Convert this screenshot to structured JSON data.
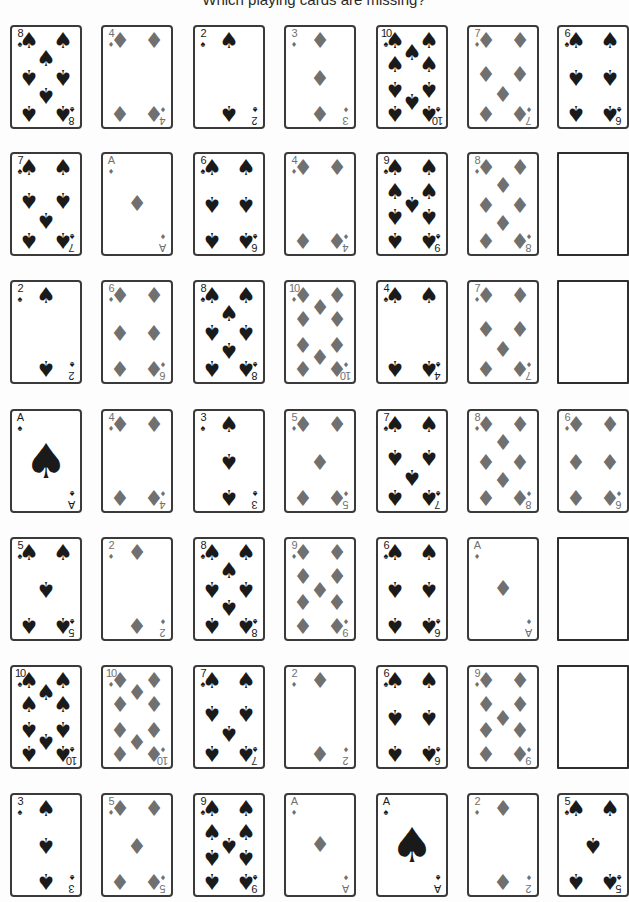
{
  "title": "Which playing cards are missing?",
  "colors": {
    "spade": "#1a1a1a",
    "diamond": "#707070",
    "border": "#3a3a3a",
    "background": "#fdfdfd"
  },
  "icons": {
    "spade": "♠",
    "diamond": "♦"
  },
  "grid": {
    "columns_x": [
      10,
      101,
      193,
      284,
      376,
      467,
      557
    ],
    "rows_y": [
      25,
      152,
      280,
      409,
      537,
      665,
      793
    ],
    "rows": [
      [
        {
          "rank": "8",
          "suit": "spade"
        },
        {
          "rank": "4",
          "suit": "diamond"
        },
        {
          "rank": "2",
          "suit": "spade"
        },
        {
          "rank": "3",
          "suit": "diamond"
        },
        {
          "rank": "10",
          "suit": "spade"
        },
        {
          "rank": "7",
          "suit": "diamond"
        },
        {
          "rank": "6",
          "suit": "spade"
        }
      ],
      [
        {
          "rank": "7",
          "suit": "spade"
        },
        {
          "rank": "A",
          "suit": "diamond"
        },
        {
          "rank": "6",
          "suit": "spade"
        },
        {
          "rank": "4",
          "suit": "diamond"
        },
        {
          "rank": "9",
          "suit": "spade"
        },
        {
          "rank": "8",
          "suit": "diamond"
        },
        {
          "rank": "",
          "suit": "blank"
        }
      ],
      [
        {
          "rank": "2",
          "suit": "spade"
        },
        {
          "rank": "6",
          "suit": "diamond"
        },
        {
          "rank": "8",
          "suit": "spade"
        },
        {
          "rank": "10",
          "suit": "diamond"
        },
        {
          "rank": "4",
          "suit": "spade"
        },
        {
          "rank": "7",
          "suit": "diamond"
        },
        {
          "rank": "",
          "suit": "blank"
        }
      ],
      [
        {
          "rank": "A",
          "suit": "spade"
        },
        {
          "rank": "4",
          "suit": "diamond"
        },
        {
          "rank": "3",
          "suit": "spade"
        },
        {
          "rank": "5",
          "suit": "diamond"
        },
        {
          "rank": "7",
          "suit": "spade"
        },
        {
          "rank": "8",
          "suit": "diamond"
        },
        {
          "rank": "6",
          "suit": "diamond"
        }
      ],
      [
        {
          "rank": "5",
          "suit": "spade"
        },
        {
          "rank": "2",
          "suit": "diamond"
        },
        {
          "rank": "8",
          "suit": "spade"
        },
        {
          "rank": "9",
          "suit": "diamond"
        },
        {
          "rank": "6",
          "suit": "spade"
        },
        {
          "rank": "A",
          "suit": "diamond"
        },
        {
          "rank": "",
          "suit": "blank"
        }
      ],
      [
        {
          "rank": "10",
          "suit": "spade"
        },
        {
          "rank": "10",
          "suit": "diamond"
        },
        {
          "rank": "7",
          "suit": "spade"
        },
        {
          "rank": "2",
          "suit": "diamond"
        },
        {
          "rank": "6",
          "suit": "spade"
        },
        {
          "rank": "9",
          "suit": "diamond"
        },
        {
          "rank": "",
          "suit": "blank"
        }
      ],
      [
        {
          "rank": "3",
          "suit": "spade"
        },
        {
          "rank": "5",
          "suit": "diamond"
        },
        {
          "rank": "9",
          "suit": "spade"
        },
        {
          "rank": "A",
          "suit": "diamond"
        },
        {
          "rank": "A",
          "suit": "spade"
        },
        {
          "rank": "2",
          "suit": "diamond"
        },
        {
          "rank": "5",
          "suit": "spade"
        }
      ]
    ]
  }
}
